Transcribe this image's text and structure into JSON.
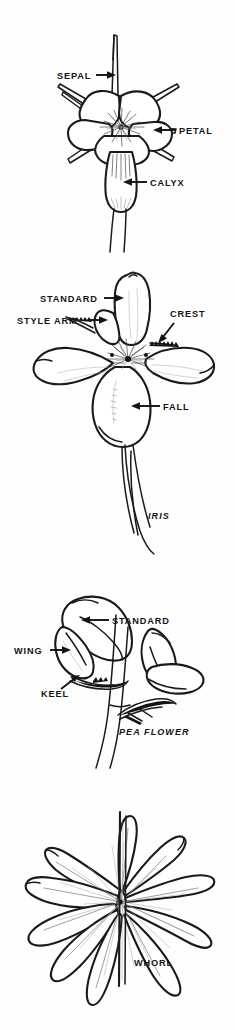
{
  "document": {
    "title": "Flower Parts — Botanical Line Diagrams",
    "background_color": "#ffffff",
    "ink_color": "#141414",
    "style": "pen-and-ink botanical line art"
  },
  "panels": [
    {
      "id": "generic-flower",
      "subject": "Generic flower with sepals, petals and calyx",
      "caption": "",
      "labels": [
        {
          "text": "SEPAL",
          "arrow": "right"
        },
        {
          "text": "PETAL",
          "arrow": "left"
        },
        {
          "text": "CALYX",
          "arrow": "left"
        }
      ]
    },
    {
      "id": "iris",
      "subject": "Iris flower",
      "caption": "IRIS",
      "labels": [
        {
          "text": "STANDARD",
          "arrow": "right"
        },
        {
          "text": "STYLE ARM",
          "arrow": "right"
        },
        {
          "text": "CREST",
          "arrow": "down-left"
        },
        {
          "text": "FALL",
          "arrow": "left"
        }
      ]
    },
    {
      "id": "pea-flower",
      "subject": "Pea flower",
      "caption": "PEA FLOWER",
      "labels": [
        {
          "text": "STANDARD",
          "arrow": "left"
        },
        {
          "text": "WING",
          "arrow": "right"
        },
        {
          "text": "KEEL",
          "arrow": "up-right"
        }
      ]
    },
    {
      "id": "whorl",
      "subject": "Whorl of leaves around a stem",
      "caption": "",
      "labels": [
        {
          "text": "WHORL",
          "arrow": "none"
        }
      ]
    }
  ],
  "flower": {
    "label_sepal": "SEPAL",
    "label_petal": "PETAL",
    "label_calyx": "CALYX"
  },
  "iris": {
    "label_standard": "STANDARD",
    "label_style_arm": "STYLE ARM",
    "label_crest": "CREST",
    "label_fall": "FALL",
    "caption": "IRIS"
  },
  "pea": {
    "label_standard": "STANDARD",
    "label_wing": "WING",
    "label_keel": "KEEL",
    "caption": "PEA FLOWER"
  },
  "whorl": {
    "label_whorl": "WHORL"
  }
}
